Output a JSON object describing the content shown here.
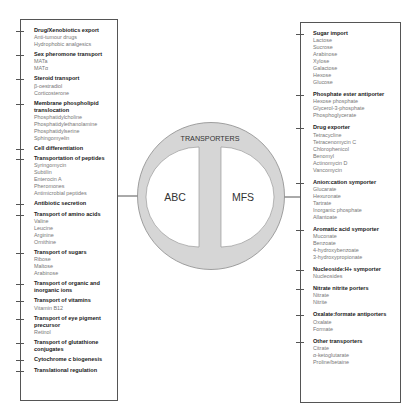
{
  "diagram": {
    "center_label": "TRANSPORTERS",
    "left_family": "ABC",
    "right_family": "MFS",
    "colors": {
      "ring_fill": "#d6d6d6",
      "ring_stroke": "#8a8a8a",
      "inner_fill": "#ffffff",
      "line": "#555555"
    }
  },
  "abc": {
    "groups": [
      {
        "title": "Drug/Xenobiotics export",
        "items": [
          "Anti-tumour drugs",
          "Hydrophobic analgesics"
        ]
      },
      {
        "title": "Sex pheromone transport",
        "items": [
          "MATa",
          "MATα"
        ]
      },
      {
        "title": "Steroid transport",
        "items": [
          "β-oestradiol",
          "Corticosterone"
        ]
      },
      {
        "title": "Membrane phospholipid translocation",
        "items": [
          "Phosphatidylcholine",
          "Phosphatidylethanolamine",
          "Phosphatidylserine",
          "Sphingomyelin"
        ]
      },
      {
        "title": "Cell differentiation",
        "items": []
      },
      {
        "title": "Transportation of peptides",
        "items": [
          "Syringomycin",
          "Subtilin",
          "Enterocin A",
          "Pheromones",
          "Antimicrobial peptides"
        ]
      },
      {
        "title": "Antibiotic secretion",
        "items": []
      },
      {
        "title": "Transport of amino acids",
        "items": [
          "Valine",
          "Leucine",
          "Arginine",
          "Ornithine"
        ]
      },
      {
        "title": "Transport of sugars",
        "items": [
          "Ribose",
          "Maltose",
          "Arabinose"
        ]
      },
      {
        "title": "Transport of organic and inorganic ions",
        "items": []
      },
      {
        "title": "Transport of vitamins",
        "items": [
          "Vitamin B12"
        ]
      },
      {
        "title": "Transport of eye pigment precursor",
        "items": [
          "Retinol"
        ]
      },
      {
        "title": "Transport of glutathione conjugates",
        "items": []
      },
      {
        "title": "Cytochrome c biogenesis",
        "items": []
      },
      {
        "title": "Translational regulation",
        "items": []
      }
    ]
  },
  "mfs": {
    "groups": [
      {
        "title": "Sugar import",
        "items": [
          "Lactose",
          "Sucrose",
          "Arabinose",
          "Xylose",
          "Galactose",
          "Hexose",
          "Glucose"
        ]
      },
      {
        "title": "Phosphate ester antiporter",
        "items": [
          "Hexose phosphate",
          "Glycerol-3-phosphate",
          "Phosphoglycerate"
        ]
      },
      {
        "title": "Drug exporter",
        "items": [
          "Tetracycline",
          "Tetracenomycin C",
          "Chlorophenicol",
          "Benomyl",
          "Actinomycin D",
          "Vancomycin"
        ]
      },
      {
        "title": "Anion:cation symporter",
        "items": [
          "Glucarate",
          "Hexuronate",
          "Tartrate",
          "Inorganic phosphate",
          "Allantoate"
        ]
      },
      {
        "title": "Aromatic acid symporter",
        "items": [
          "Muconate",
          "Benzoate",
          "4-hydroxybenzoate",
          "3-hydroxypropionate"
        ]
      },
      {
        "title": "Nucleoside:H+ symporter",
        "items": [
          "Nucleosides"
        ]
      },
      {
        "title": "Nitrate nitrite porters",
        "items": [
          "Nitrate",
          "Nitrite"
        ]
      },
      {
        "title": "Oxalate:formate antiporters",
        "items": [
          "Oxalate",
          "Formate"
        ]
      },
      {
        "title": "Other transporters",
        "items": [
          "Citrate",
          "α-ketoglutarate",
          "Proline/betaine"
        ]
      }
    ]
  }
}
